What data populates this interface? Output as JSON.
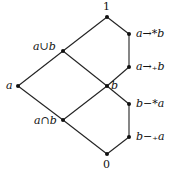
{
  "diagram": {
    "type": "hasse-lattice",
    "nodes": [
      {
        "id": "top",
        "label": "1",
        "x": 107,
        "y": 17
      },
      {
        "id": "join",
        "label": "a∪b",
        "x": 63,
        "y": 51
      },
      {
        "id": "impl_star",
        "label": "a→*b",
        "x": 129,
        "y": 34
      },
      {
        "id": "impl_sub",
        "label": "a→₊b",
        "x": 129,
        "y": 67
      },
      {
        "id": "a",
        "label": "a",
        "x": 18,
        "y": 86
      },
      {
        "id": "b",
        "label": "b",
        "x": 107,
        "y": 86
      },
      {
        "id": "diff_star",
        "label": "b−*a",
        "x": 129,
        "y": 104
      },
      {
        "id": "diff_sub",
        "label": "b−₊a",
        "x": 129,
        "y": 137
      },
      {
        "id": "meet",
        "label": "a∩b",
        "x": 63,
        "y": 120
      },
      {
        "id": "bottom",
        "label": "0",
        "x": 107,
        "y": 154
      }
    ],
    "edges": [
      [
        "top",
        "join"
      ],
      [
        "top",
        "impl_star"
      ],
      [
        "impl_star",
        "impl_sub"
      ],
      [
        "impl_sub",
        "b"
      ],
      [
        "join",
        "a"
      ],
      [
        "join",
        "b"
      ],
      [
        "a",
        "meet"
      ],
      [
        "b",
        "meet"
      ],
      [
        "b",
        "diff_star"
      ],
      [
        "diff_star",
        "diff_sub"
      ],
      [
        "diff_sub",
        "bottom"
      ],
      [
        "meet",
        "bottom"
      ]
    ],
    "colors": {
      "line": "#222222",
      "node": "#111111"
    }
  }
}
